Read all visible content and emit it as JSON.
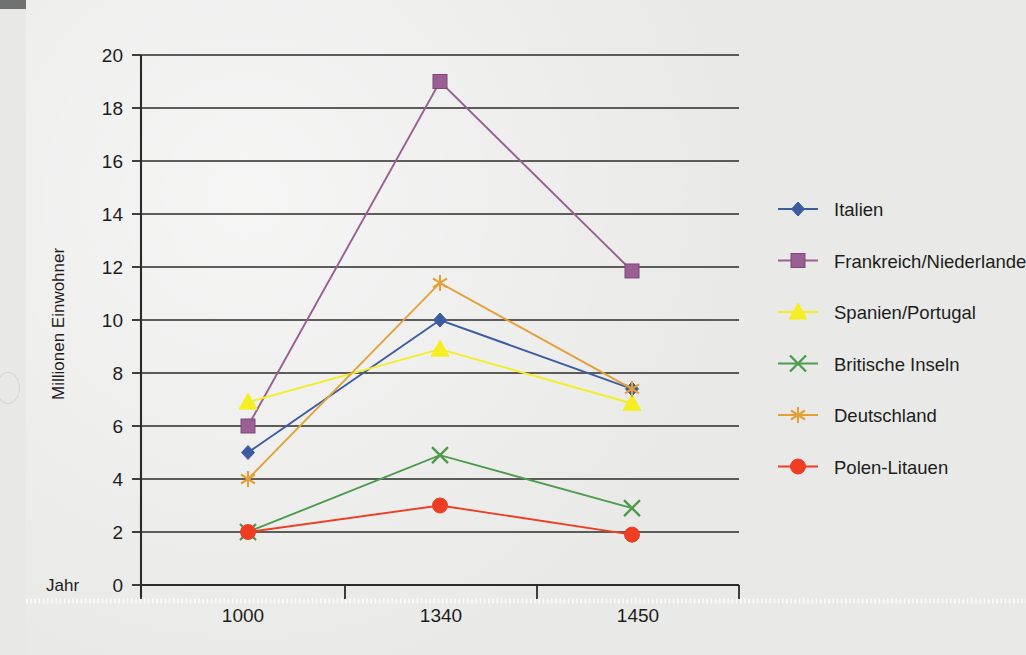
{
  "chart_data": {
    "type": "line",
    "title": "",
    "xlabel": "Jahr",
    "ylabel": "Millionen Einwohner",
    "x": [
      1000,
      1340,
      1450
    ],
    "categories": [
      "1000",
      "1340",
      "1450"
    ],
    "xtick_labels": [
      "1000",
      "1340",
      "1450"
    ],
    "ytick_labels": [
      "0",
      "2",
      "4",
      "6",
      "8",
      "10",
      "12",
      "14",
      "16",
      "18",
      "20"
    ],
    "yticks": [
      0,
      2,
      4,
      6,
      8,
      10,
      12,
      14,
      16,
      18,
      20
    ],
    "ylim": [
      0,
      20
    ],
    "grid": "horizontal",
    "legend_position": "right",
    "series": [
      {
        "name": "Italien",
        "color": "#3c5ba0",
        "marker": "diamond",
        "values": [
          5.0,
          10.0,
          7.4
        ]
      },
      {
        "name": "Frankreich/Niederlande",
        "color": "#9a5f93",
        "marker": "square",
        "values": [
          6.0,
          19.0,
          11.85
        ]
      },
      {
        "name": "Spanien/Portugal",
        "color": "#f5ee25",
        "marker": "triangle",
        "values": [
          6.9,
          8.9,
          6.85
        ]
      },
      {
        "name": "Britische Inseln",
        "color": "#4e9a4e",
        "marker": "x",
        "values": [
          2.0,
          4.9,
          2.9
        ]
      },
      {
        "name": "Deutschland",
        "color": "#e3a13a",
        "marker": "asterisk",
        "values": [
          4.0,
          11.4,
          7.4
        ]
      },
      {
        "name": "Polen-Litauen",
        "color": "#ee3d23",
        "marker": "circle",
        "values": [
          2.0,
          3.0,
          1.9
        ]
      }
    ]
  },
  "axis": {
    "y_title": "Millionen Einwohner",
    "x_title": "Jahr",
    "origin_label": "0"
  },
  "legend": {
    "items": [
      {
        "label": "Italien"
      },
      {
        "label": "Frankreich/Niederlande"
      },
      {
        "label": "Spanien/Portugal"
      },
      {
        "label": "Britische Inseln"
      },
      {
        "label": "Deutschland"
      },
      {
        "label": "Polen-Litauen"
      }
    ]
  },
  "ticks": {
    "y": [
      {
        "label": "20"
      },
      {
        "label": "18"
      },
      {
        "label": "16"
      },
      {
        "label": "14"
      },
      {
        "label": "12"
      },
      {
        "label": "10"
      },
      {
        "label": "8"
      },
      {
        "label": "6"
      },
      {
        "label": "4"
      },
      {
        "label": "2"
      },
      {
        "label": "0"
      }
    ],
    "x": [
      {
        "label": "1000"
      },
      {
        "label": "1340"
      },
      {
        "label": "1450"
      }
    ]
  },
  "colors": {
    "background": "#e9eae8",
    "ink": "#1d1d1b",
    "italien": "#3c5ba0",
    "frankreich": "#9a5f93",
    "spanien": "#f5ee25",
    "britische": "#4e9a4e",
    "deutschland": "#e3a13a",
    "polen": "#ee3d23"
  }
}
